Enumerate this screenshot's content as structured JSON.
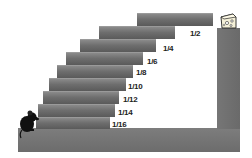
{
  "diagram": {
    "steps": [
      {
        "label": "1/2",
        "x": 137,
        "y": 13,
        "w": 76,
        "h": 13,
        "lx": 190,
        "ly": 29
      },
      {
        "label": "1/4",
        "x": 99,
        "y": 26,
        "w": 76,
        "h": 13,
        "lx": 163,
        "ly": 44
      },
      {
        "label": "1/6",
        "x": 80,
        "y": 39,
        "w": 76,
        "h": 13,
        "lx": 147,
        "ly": 57
      },
      {
        "label": "1/8",
        "x": 66,
        "y": 52,
        "w": 77,
        "h": 13,
        "lx": 136,
        "ly": 68
      },
      {
        "label": "1/10",
        "x": 57,
        "y": 65,
        "w": 76,
        "h": 13,
        "lx": 128,
        "ly": 82
      },
      {
        "label": "1/12",
        "x": 49,
        "y": 78,
        "w": 77,
        "h": 13,
        "lx": 123,
        "ly": 95
      },
      {
        "label": "1/14",
        "x": 43,
        "y": 91,
        "w": 76,
        "h": 13,
        "lx": 118,
        "ly": 108
      },
      {
        "label": "1/16",
        "x": 38,
        "y": 104,
        "w": 77,
        "h": 13,
        "lx": 112,
        "ly": 120
      }
    ],
    "bottom_step": {
      "x": 36,
      "y": 117,
      "w": 74,
      "h": 12
    },
    "floor": {
      "x": 18,
      "y": 128,
      "w": 222,
      "h": 24
    },
    "pillar": {
      "x": 217,
      "y": 28,
      "w": 23,
      "h": 100
    },
    "icons": {
      "mouse": "mouse-icon",
      "cheese": "cheese-icon"
    }
  }
}
